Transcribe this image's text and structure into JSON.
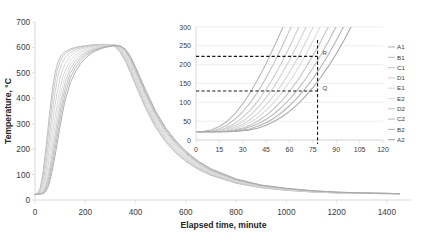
{
  "chart_data": [
    {
      "id": "main",
      "type": "line",
      "title": "",
      "xlabel": "Elapsed time, minute",
      "ylabel": "Temperature, °C",
      "xlim": [
        0,
        1500
      ],
      "ylim": [
        0,
        700
      ],
      "xticks": [
        0,
        200,
        400,
        600,
        800,
        1000,
        1200,
        1400
      ],
      "yticks": [
        0,
        100,
        200,
        300,
        400,
        500,
        600,
        700
      ],
      "grid": false,
      "legend_position": "right",
      "x": [
        0,
        10,
        20,
        30,
        40,
        50,
        60,
        70,
        80,
        90,
        100,
        110,
        120,
        140,
        160,
        180,
        200,
        220,
        240,
        260,
        280,
        300,
        320,
        340,
        360,
        380,
        400,
        440,
        480,
        520,
        560,
        600,
        650,
        700,
        800,
        900,
        1000,
        1100,
        1200,
        1300,
        1400,
        1450
      ],
      "series": [
        {
          "name": "A1",
          "color": "#b9b9b9",
          "values": [
            22,
            26,
            45,
            95,
            175,
            265,
            360,
            440,
            500,
            540,
            562,
            575,
            583,
            594,
            600,
            604,
            607,
            609,
            611,
            612,
            612,
            610,
            602,
            580,
            545,
            500,
            452,
            360,
            285,
            228,
            185,
            152,
            120,
            97,
            66,
            48,
            38,
            32,
            28,
            26,
            25,
            24
          ]
        },
        {
          "name": "B1",
          "color": "#c2c2c2",
          "values": [
            22,
            25,
            38,
            78,
            148,
            232,
            320,
            402,
            468,
            515,
            545,
            563,
            575,
            589,
            597,
            602,
            605,
            608,
            610,
            611,
            612,
            611,
            605,
            586,
            552,
            508,
            460,
            368,
            292,
            234,
            190,
            156,
            123,
            99,
            67,
            49,
            38,
            32,
            28,
            26,
            25,
            24
          ]
        },
        {
          "name": "C1",
          "color": "#cacaca",
          "values": [
            22,
            24,
            32,
            60,
            118,
            192,
            275,
            355,
            425,
            480,
            518,
            544,
            560,
            580,
            591,
            598,
            602,
            606,
            608,
            610,
            611,
            611,
            607,
            591,
            560,
            518,
            470,
            377,
            300,
            241,
            196,
            161,
            127,
            102,
            69,
            50,
            39,
            33,
            28,
            26,
            25,
            24
          ]
        },
        {
          "name": "D1",
          "color": "#d0d0d0",
          "values": [
            22,
            24,
            28,
            46,
            92,
            155,
            230,
            305,
            375,
            435,
            480,
            513,
            536,
            566,
            582,
            592,
            598,
            603,
            606,
            608,
            610,
            611,
            608,
            595,
            568,
            528,
            480,
            387,
            308,
            248,
            202,
            166,
            131,
            105,
            71,
            51,
            40,
            33,
            29,
            26,
            25,
            24
          ]
        },
        {
          "name": "E1",
          "color": "#d6d6d6",
          "values": [
            22,
            23,
            26,
            37,
            70,
            122,
            187,
            258,
            325,
            388,
            440,
            480,
            510,
            548,
            570,
            583,
            592,
            599,
            603,
            606,
            609,
            610,
            609,
            598,
            574,
            536,
            489,
            396,
            316,
            255,
            208,
            171,
            135,
            108,
            73,
            53,
            41,
            34,
            29,
            27,
            25,
            24
          ]
        },
        {
          "name": "E2",
          "color": "#dcdcdc",
          "values": [
            22,
            23,
            25,
            32,
            56,
            100,
            158,
            224,
            290,
            352,
            406,
            452,
            487,
            532,
            558,
            575,
            586,
            594,
            600,
            604,
            607,
            609,
            609,
            600,
            579,
            543,
            497,
            404,
            323,
            261,
            213,
            176,
            139,
            111,
            75,
            54,
            42,
            34,
            29,
            27,
            25,
            24
          ]
        },
        {
          "name": "D2",
          "color": "#c6c6c6",
          "values": [
            22,
            23,
            24,
            29,
            46,
            82,
            132,
            192,
            256,
            318,
            374,
            423,
            463,
            514,
            545,
            566,
            579,
            589,
            596,
            601,
            605,
            608,
            609,
            602,
            583,
            549,
            504,
            412,
            330,
            267,
            218,
            180,
            142,
            114,
            77,
            55,
            43,
            35,
            30,
            27,
            26,
            25
          ]
        },
        {
          "name": "C2",
          "color": "#bdbdbd",
          "values": [
            22,
            23,
            24,
            27,
            39,
            68,
            111,
            166,
            226,
            288,
            345,
            396,
            440,
            497,
            532,
            557,
            573,
            585,
            593,
            599,
            604,
            607,
            609,
            604,
            587,
            555,
            511,
            419,
            337,
            273,
            223,
            184,
            146,
            117,
            79,
            57,
            44,
            36,
            30,
            27,
            26,
            25
          ]
        },
        {
          "name": "B2",
          "color": "#b4b4b4",
          "values": [
            22,
            23,
            24,
            26,
            34,
            56,
            93,
            143,
            199,
            259,
            317,
            370,
            417,
            479,
            518,
            546,
            566,
            580,
            590,
            596,
            602,
            606,
            608,
            605,
            590,
            560,
            517,
            426,
            343,
            278,
            228,
            188,
            149,
            120,
            81,
            58,
            45,
            36,
            31,
            28,
            26,
            25
          ]
        },
        {
          "name": "A2",
          "color": "#a8a8a8",
          "values": [
            22,
            23,
            23,
            25,
            30,
            46,
            77,
            122,
            174,
            232,
            290,
            344,
            393,
            460,
            503,
            534,
            557,
            574,
            586,
            594,
            600,
            604,
            607,
            606,
            593,
            565,
            523,
            433,
            350,
            284,
            233,
            192,
            153,
            123,
            83,
            59,
            46,
            37,
            31,
            28,
            26,
            25
          ]
        }
      ]
    },
    {
      "id": "inset",
      "type": "line",
      "title": "",
      "xlabel": "",
      "ylabel": "",
      "xlim": [
        0,
        120
      ],
      "ylim": [
        0,
        300
      ],
      "xticks": [
        0,
        15,
        30,
        45,
        60,
        75,
        90,
        105,
        120
      ],
      "yticks": [
        0,
        50,
        100,
        150,
        200,
        250,
        300
      ],
      "grid": true,
      "annotations": [
        {
          "label": "R",
          "x": 78,
          "y": 222
        },
        {
          "label": "Q",
          "x": 78,
          "y": 130
        }
      ],
      "reference_lines": [
        {
          "orientation": "horizontal",
          "value": 222,
          "style": "dashed"
        },
        {
          "orientation": "horizontal",
          "value": 130,
          "style": "dashed"
        },
        {
          "orientation": "vertical",
          "value": 78,
          "style": "dashed"
        }
      ],
      "x": [
        0,
        5,
        10,
        15,
        20,
        25,
        30,
        35,
        40,
        45,
        50,
        55,
        60,
        65,
        70,
        75,
        78,
        80,
        85,
        90,
        95,
        100,
        105,
        110,
        115,
        120
      ],
      "series": [
        {
          "name": "A1",
          "color": "#b9b9b9",
          "values": [
            22,
            23,
            27,
            36,
            50,
            70,
            96,
            127,
            163,
            203,
            247,
            292,
            340,
            390,
            440,
            492,
            523,
            545,
            598,
            652,
            706,
            760,
            814,
            868,
            922,
            976
          ]
        },
        {
          "name": "B1",
          "color": "#c2c2c2",
          "values": [
            22,
            22,
            24,
            30,
            40,
            55,
            75,
            100,
            130,
            165,
            204,
            246,
            291,
            338,
            387,
            437,
            468,
            489,
            541,
            594,
            648,
            702,
            756,
            810,
            864,
            918
          ]
        },
        {
          "name": "C1",
          "color": "#cacaca",
          "values": [
            22,
            22,
            23,
            26,
            33,
            44,
            60,
            80,
            105,
            134,
            168,
            206,
            247,
            291,
            337,
            385,
            415,
            435,
            486,
            538,
            591,
            644,
            698,
            752,
            806,
            860
          ]
        },
        {
          "name": "D1",
          "color": "#d0d0d0",
          "values": [
            22,
            22,
            23,
            25,
            30,
            38,
            50,
            66,
            87,
            112,
            141,
            175,
            212,
            252,
            295,
            340,
            368,
            387,
            435,
            485,
            536,
            588,
            640,
            693,
            746,
            799
          ]
        },
        {
          "name": "E1",
          "color": "#d6d6d6",
          "values": [
            22,
            22,
            22,
            24,
            27,
            33,
            42,
            55,
            72,
            93,
            118,
            147,
            180,
            216,
            256,
            298,
            324,
            342,
            388,
            436,
            486,
            536,
            588,
            640,
            692,
            745
          ]
        },
        {
          "name": "E2",
          "color": "#dcdcdc",
          "values": [
            22,
            22,
            22,
            23,
            25,
            30,
            37,
            47,
            61,
            79,
            100,
            125,
            154,
            187,
            223,
            262,
            286,
            303,
            346,
            392,
            439,
            488,
            538,
            589,
            640,
            692
          ]
        },
        {
          "name": "D2",
          "color": "#c6c6c6",
          "values": [
            22,
            22,
            22,
            23,
            24,
            27,
            32,
            40,
            51,
            65,
            83,
            104,
            129,
            157,
            189,
            224,
            246,
            261,
            301,
            344,
            389,
            436,
            484,
            534,
            584,
            635
          ]
        },
        {
          "name": "C2",
          "color": "#bdbdbd",
          "values": [
            22,
            22,
            22,
            22,
            23,
            25,
            29,
            35,
            43,
            55,
            69,
            87,
            108,
            133,
            160,
            191,
            211,
            225,
            262,
            302,
            344,
            388,
            434,
            482,
            531,
            581
          ]
        },
        {
          "name": "B2",
          "color": "#b4b4b4",
          "values": [
            22,
            22,
            22,
            22,
            23,
            24,
            26,
            30,
            37,
            46,
            58,
            73,
            91,
            112,
            136,
            163,
            181,
            193,
            227,
            264,
            303,
            345,
            389,
            435,
            482,
            531
          ]
        },
        {
          "name": "A2",
          "color": "#a8a8a8",
          "values": [
            22,
            22,
            22,
            22,
            22,
            23,
            25,
            27,
            32,
            39,
            49,
            61,
            76,
            94,
            115,
            139,
            155,
            166,
            196,
            229,
            265,
            304,
            345,
            389,
            435,
            482
          ]
        }
      ]
    }
  ],
  "legend": {
    "items": [
      {
        "label": "A1",
        "color": "#b9b9b9"
      },
      {
        "label": "B1",
        "color": "#c2c2c2"
      },
      {
        "label": "C1",
        "color": "#cacaca"
      },
      {
        "label": "D1",
        "color": "#d0d0d0"
      },
      {
        "label": "E1",
        "color": "#d6d6d6"
      },
      {
        "label": "E2",
        "color": "#dcdcdc"
      },
      {
        "label": "D2",
        "color": "#c6c6c6"
      },
      {
        "label": "C2",
        "color": "#bdbdbd"
      },
      {
        "label": "B2",
        "color": "#b4b4b4"
      },
      {
        "label": "A2",
        "color": "#a8a8a8"
      }
    ]
  },
  "colors": {
    "axis": "#d9d9d9",
    "text": "#3b3b3b",
    "title_text": "#242424",
    "grid": "#e8e8e8",
    "dashed": "#1a1a1a",
    "background": "#ffffff"
  }
}
